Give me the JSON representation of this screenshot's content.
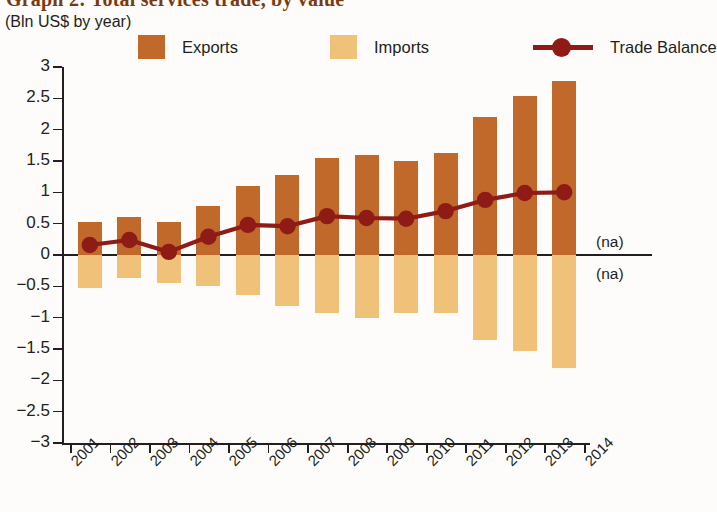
{
  "header": {
    "title": "Graph 2: Total services trade, by value",
    "subtitle": "(Bln US$ by year)"
  },
  "legend": {
    "items": [
      {
        "label": "Exports",
        "type": "swatch",
        "color": "#C1692B"
      },
      {
        "label": "Imports",
        "type": "swatch",
        "color": "#F0C178"
      },
      {
        "label": "Trade Balance",
        "type": "line",
        "color": "#8E1B15"
      }
    ]
  },
  "annotations": {
    "na_above": "(na)",
    "na_below": "(na)"
  },
  "chart_data": {
    "type": "bar",
    "title": "Graph 2: Total services trade, by value",
    "subtitle": "(Bln US$ by year)",
    "xlabel": "",
    "ylabel": "Bln US$ by year",
    "ylim": [
      -3,
      3
    ],
    "ytick_step": 0.5,
    "yticks": [
      "3",
      "2.5",
      "2",
      "1.5",
      "1",
      "0.5",
      "0",
      "-0.5",
      "-1",
      "-1.5",
      "-2",
      "-2.5",
      "-3"
    ],
    "ytick_values": [
      3,
      2.5,
      2,
      1.5,
      1,
      0.5,
      0,
      -0.5,
      -1,
      -1.5,
      -2,
      -2.5,
      -3
    ],
    "xticks": [
      "2001",
      "2002",
      "2003",
      "2004",
      "2005",
      "2006",
      "2007",
      "2008",
      "2009",
      "2010",
      "2011",
      "2012",
      "2013",
      "2014"
    ],
    "categories": [
      "2001",
      "2002",
      "2003",
      "2004",
      "2005",
      "2006",
      "2007",
      "2008",
      "2009",
      "2010",
      "2011",
      "2012",
      "2013"
    ],
    "grid": false,
    "legend_position": "top",
    "series": [
      {
        "name": "Exports",
        "type": "bar",
        "color": "#C1692B",
        "values": [
          0.52,
          0.6,
          0.53,
          0.78,
          1.1,
          1.28,
          1.54,
          1.6,
          1.5,
          1.63,
          2.2,
          2.53,
          2.77
        ]
      },
      {
        "name": "Imports",
        "type": "bar",
        "color": "#F0C178",
        "values": [
          -0.53,
          -0.36,
          -0.44,
          -0.49,
          -0.64,
          -0.81,
          -0.92,
          -1.0,
          -0.92,
          -0.93,
          -1.35,
          -1.53,
          -1.8
        ]
      },
      {
        "name": "Trade Balance",
        "type": "line",
        "color": "#8E1B15",
        "values": [
          0.16,
          0.24,
          0.05,
          0.29,
          0.48,
          0.46,
          0.62,
          0.59,
          0.58,
          0.7,
          0.88,
          0.99,
          1.0
        ]
      }
    ]
  }
}
